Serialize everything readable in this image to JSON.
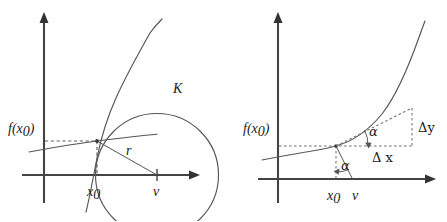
{
  "figure": {
    "background_color": "#ffffff",
    "ink_color": "#333333",
    "panels": [
      {
        "id": "left",
        "name": "osculating-circle-panel",
        "labels": {
          "f_of_x0": "f(x",
          "f_of_x0_sub": "0",
          "f_of_x0_close": ")",
          "curve_circle": "K",
          "radius": "r",
          "x_zero": "x",
          "x_zero_sub": "0",
          "center": "v"
        }
      },
      {
        "id": "right",
        "name": "tangent-slope-panel",
        "labels": {
          "f_of_x0": "f(x",
          "f_of_x0_sub": "0",
          "f_of_x0_close": ")",
          "angle_upper": "α",
          "angle_lower": "α",
          "delta_y": "Δy",
          "delta_x": "Δ x",
          "x_zero": "x",
          "x_zero_sub": "0",
          "center": "v"
        }
      }
    ],
    "axes": {
      "x_axis_name": "x-axis",
      "y_axis_name": "y-axis"
    }
  }
}
